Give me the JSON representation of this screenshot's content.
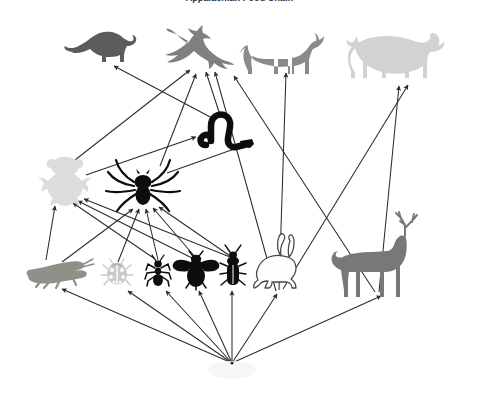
{
  "title": "Appalachian Food Chain",
  "canvas": {
    "width": 479,
    "height": 397,
    "background": "#ffffff"
  },
  "colors": {
    "arrow": "#2b2b2b",
    "weasel": "#5c5c5c",
    "eagle": "#808080",
    "wolf": "#8a8a8a",
    "cougar": "#d2d2d2",
    "snake": "#0d0d0d",
    "frog": "#dcdcdc",
    "spider": "#0d0d0d",
    "grasshopper": "#8f9189",
    "ladybug": "#c9c9c9",
    "ant": "#0d0d0d",
    "bee": "#0d0d0d",
    "beetle": "#0d0d0d",
    "rabbit": "#fdfdfd",
    "rabbit_outline": "#4a4a4a",
    "deer": "#787878",
    "plants": "#f2f2f2"
  },
  "organisms": [
    {
      "id": "weasel",
      "name": "weasel",
      "trophic": "tertiary consumer",
      "x": 97,
      "y": 47
    },
    {
      "id": "eagle",
      "name": "eagle",
      "trophic": "tertiary consumer",
      "x": 196,
      "y": 47
    },
    {
      "id": "wolf",
      "name": "wolf",
      "trophic": "tertiary consumer",
      "x": 283,
      "y": 45
    },
    {
      "id": "cougar",
      "name": "cougar",
      "trophic": "tertiary consumer",
      "x": 395,
      "y": 42
    },
    {
      "id": "snake",
      "name": "snake",
      "trophic": "secondary consumer",
      "x": 224,
      "y": 131
    },
    {
      "id": "frog",
      "name": "frog",
      "trophic": "secondary consumer",
      "x": 62,
      "y": 180
    },
    {
      "id": "spider",
      "name": "spider",
      "trophic": "secondary consumer",
      "x": 143,
      "y": 185
    },
    {
      "id": "grasshopper",
      "name": "grasshopper",
      "trophic": "primary consumer",
      "x": 52,
      "y": 272
    },
    {
      "id": "ladybug",
      "name": "ladybug",
      "trophic": "primary consumer",
      "x": 117,
      "y": 273
    },
    {
      "id": "ant",
      "name": "ant",
      "trophic": "primary consumer",
      "x": 158,
      "y": 273
    },
    {
      "id": "bee",
      "name": "bee",
      "trophic": "primary consumer",
      "x": 196,
      "y": 272
    },
    {
      "id": "beetle",
      "name": "beetle",
      "trophic": "primary consumer",
      "x": 233,
      "y": 271
    },
    {
      "id": "rabbit",
      "name": "rabbit",
      "trophic": "primary consumer",
      "x": 285,
      "y": 264
    },
    {
      "id": "deer",
      "name": "deer",
      "trophic": "primary consumer",
      "x": 384,
      "y": 258
    },
    {
      "id": "plants",
      "name": "plants",
      "trophic": "producer",
      "x": 232,
      "y": 365
    }
  ],
  "connections": [
    {
      "from": "plants",
      "to": "grasshopper"
    },
    {
      "from": "plants",
      "to": "ladybug"
    },
    {
      "from": "plants",
      "to": "ant"
    },
    {
      "from": "plants",
      "to": "bee"
    },
    {
      "from": "plants",
      "to": "beetle"
    },
    {
      "from": "plants",
      "to": "rabbit"
    },
    {
      "from": "plants",
      "to": "deer"
    },
    {
      "from": "grasshopper",
      "to": "spider"
    },
    {
      "from": "grasshopper",
      "to": "frog"
    },
    {
      "from": "ladybug",
      "to": "spider"
    },
    {
      "from": "ant",
      "to": "spider"
    },
    {
      "from": "ant",
      "to": "frog"
    },
    {
      "from": "bee",
      "to": "spider"
    },
    {
      "from": "bee",
      "to": "frog"
    },
    {
      "from": "beetle",
      "to": "spider"
    },
    {
      "from": "beetle",
      "to": "frog"
    },
    {
      "from": "frog",
      "to": "snake"
    },
    {
      "from": "spider",
      "to": "snake"
    },
    {
      "from": "spider",
      "to": "eagle"
    },
    {
      "from": "snake",
      "to": "eagle"
    },
    {
      "from": "snake",
      "to": "weasel"
    },
    {
      "from": "frog",
      "to": "weasel"
    },
    {
      "from": "rabbit",
      "to": "eagle"
    },
    {
      "from": "rabbit",
      "to": "wolf"
    },
    {
      "from": "rabbit",
      "to": "cougar"
    },
    {
      "from": "deer",
      "to": "wolf"
    },
    {
      "from": "deer",
      "to": "cougar"
    }
  ]
}
